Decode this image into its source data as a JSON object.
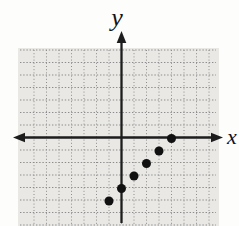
{
  "figure": {
    "background": "#fdfdfc",
    "panel_color": "#e9e8e5",
    "grid_dot_color": "#8c8c8c",
    "axis_color": "#1d1d1d",
    "point_color": "#111111",
    "label_color": "#141414"
  },
  "chart_data": {
    "type": "scatter",
    "title": "",
    "xlabel": "x",
    "ylabel": "y",
    "points": [
      {
        "x": -1,
        "y": -5
      },
      {
        "x": 0,
        "y": -4
      },
      {
        "x": 1,
        "y": -3
      },
      {
        "x": 2,
        "y": -2
      },
      {
        "x": 3,
        "y": -1
      },
      {
        "x": 4,
        "y": 0
      }
    ],
    "pattern": "points lie on the line y = x - 4",
    "xlim": [
      -7,
      7
    ],
    "ylim": [
      -7,
      7
    ],
    "grid": "dotted",
    "grid_spacing_units": 1,
    "legend": "none",
    "tick_labels": "none"
  },
  "layout": {
    "canvas": {
      "width": 239,
      "height": 226
    },
    "origin_px": {
      "x": 121.5,
      "y": 137.5
    },
    "unit_px": 12.5,
    "panel": {
      "left": 18,
      "top": 48,
      "width": 201,
      "height": 178
    },
    "grid_half_count": 7,
    "point_radius_px": 4.5,
    "axis_stroke_px": 2.3,
    "x_axis": {
      "left_tip": 13,
      "right_tip": 223
    },
    "y_axis": {
      "top_tip": 31,
      "bottom_end": 223
    },
    "x_label_pos": {
      "x": 227,
      "y": 144,
      "size": 22
    },
    "y_label_pos": {
      "x": 117,
      "y": 26,
      "size": 26
    }
  }
}
